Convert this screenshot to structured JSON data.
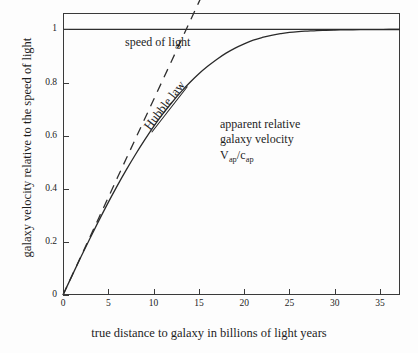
{
  "chart_data": {
    "type": "line",
    "title": "",
    "xlabel": "true distance to galaxy in billions of light years",
    "ylabel": "galaxy velocity relative to the speed of light",
    "xlim": [
      0,
      37.2
    ],
    "ylim": [
      0,
      1.062
    ],
    "grid": false,
    "legend_position": "inline-annotations",
    "xticks": [
      {
        "value": 0,
        "label": "0"
      },
      {
        "value": 5,
        "label": "5"
      },
      {
        "value": 10,
        "label": "10"
      },
      {
        "value": 15,
        "label": "15"
      },
      {
        "value": 20,
        "label": "20"
      },
      {
        "value": 25,
        "label": "25"
      },
      {
        "value": 30,
        "label": "30"
      },
      {
        "value": 35,
        "label": "35"
      }
    ],
    "yticks": [
      {
        "value": 0,
        "label": "0"
      },
      {
        "value": 0.2,
        "label": "0.2"
      },
      {
        "value": 0.4,
        "label": "0.4"
      },
      {
        "value": 0.6,
        "label": "0.6"
      },
      {
        "value": 0.8,
        "label": "0.8"
      },
      {
        "value": 1,
        "label": "1"
      }
    ],
    "series": [
      {
        "name": "speed of light",
        "style": "solid-horizontal-asymptote",
        "x": [
          0,
          37.2
        ],
        "values": [
          1,
          1
        ]
      },
      {
        "name": "Hubble law",
        "style": "dashed",
        "x": [
          0,
          1,
          2,
          3,
          4,
          5,
          6,
          7,
          8,
          9,
          10,
          11,
          12,
          13,
          14,
          15,
          16,
          17
        ],
        "values": [
          0,
          0.0735,
          0.147,
          0.2206,
          0.2941,
          0.3676,
          0.4412,
          0.5147,
          0.5882,
          0.6618,
          0.7353,
          0.8088,
          0.8824,
          0.9559,
          1.0294,
          1.1029,
          1.1765,
          1.25
        ]
      },
      {
        "name": "apparent relative galaxy velocity",
        "style": "solid-curve",
        "x": [
          0,
          1,
          2,
          3,
          4,
          5,
          6,
          7,
          8,
          9,
          10,
          11,
          12,
          13,
          14,
          15,
          16,
          17,
          18,
          19,
          20,
          21,
          22,
          23,
          24,
          25,
          26,
          27,
          28,
          29,
          30,
          31,
          32,
          33,
          34,
          35,
          36,
          37.2
        ],
        "values": [
          0,
          0.073,
          0.145,
          0.215,
          0.283,
          0.349,
          0.412,
          0.472,
          0.529,
          0.583,
          0.634,
          0.681,
          0.724,
          0.764,
          0.8,
          0.833,
          0.862,
          0.888,
          0.911,
          0.93,
          0.946,
          0.96,
          0.97,
          0.978,
          0.984,
          0.989,
          0.992,
          0.994,
          0.996,
          0.997,
          0.998,
          0.9985,
          0.999,
          0.9993,
          0.9995,
          0.9997,
          0.9998,
          0.9999
        ]
      }
    ],
    "annotations": [
      {
        "name": "speed-of-light",
        "text": "speed of light"
      },
      {
        "name": "hubble-law",
        "text": "Hubble law"
      },
      {
        "name": "apparent-line1",
        "text": "apparent relative"
      },
      {
        "name": "apparent-line2",
        "text": "galaxy velocity"
      },
      {
        "name": "apparent-formula-v",
        "text": "V"
      },
      {
        "name": "apparent-formula-v-sub",
        "text": "ap"
      },
      {
        "name": "apparent-formula-sep",
        "text": "/c"
      },
      {
        "name": "apparent-formula-c-sub",
        "text": "ap"
      }
    ]
  },
  "colors": {
    "ink": "#1d1d1d",
    "axis": "#3a3a3a",
    "background": "#fdfdfd"
  }
}
